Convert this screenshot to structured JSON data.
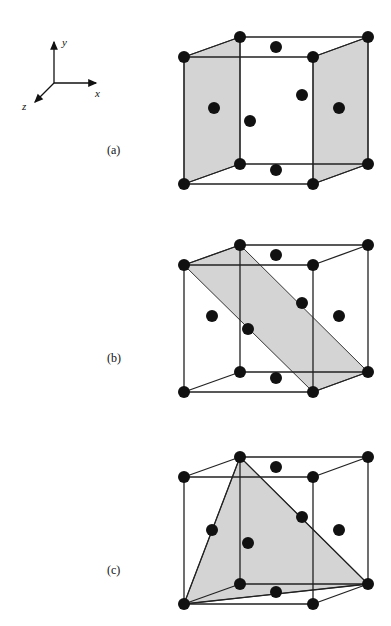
{
  "axes": {
    "x_label": "x",
    "y_label": "y",
    "z_label": "z"
  },
  "panels": [
    {
      "label": "(a)",
      "plane": "(100) planes – two opposite faces shaded",
      "offset_y": 0
    },
    {
      "label": "(b)",
      "plane": "(110) plane – diagonal rectangle shaded",
      "offset_y": 208
    },
    {
      "label": "(c)",
      "plane": "(111) plane – triangular section shaded",
      "offset_y": 420
    }
  ],
  "colors": {
    "plane_fill": "#d4d4d4",
    "edge": "#222222",
    "atom": "#111111"
  }
}
